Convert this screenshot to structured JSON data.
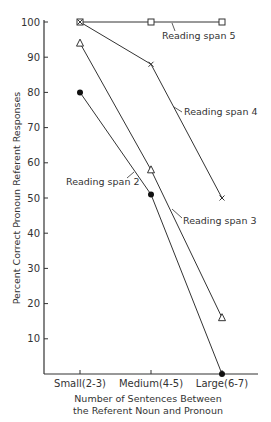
{
  "chart_data": {
    "type": "line",
    "title": "",
    "xlabel": "Number of Sentences Between the Referent Noun and Pronoun",
    "xlabel_lines": [
      "Number of Sentences Between",
      "the Referent Noun and Pronoun"
    ],
    "ylabel": "Percent Correct Pronoun Referent Responses",
    "ylim": [
      0,
      100
    ],
    "yticks": [
      10,
      20,
      30,
      40,
      50,
      60,
      70,
      80,
      90,
      100
    ],
    "grid": false,
    "legend": "inline annotations",
    "categories": [
      "Small(2-3)",
      "Medium(4-5)",
      "Large(6-7)"
    ],
    "series": [
      {
        "name": "Reading span 5",
        "marker": "square-open",
        "values": [
          100,
          100,
          100
        ]
      },
      {
        "name": "Reading span 4",
        "marker": "x",
        "values": [
          100,
          88,
          50
        ]
      },
      {
        "name": "Reading span 3",
        "marker": "triangle-open",
        "values": [
          94,
          58,
          16
        ]
      },
      {
        "name": "Reading span 2",
        "marker": "circle-filled",
        "values": [
          80,
          51,
          0
        ]
      }
    ]
  }
}
